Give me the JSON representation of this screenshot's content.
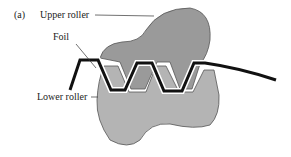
{
  "figure": {
    "panel_label": "(a)",
    "labels": {
      "upper_roller": "Upper roller",
      "foil": "Foil",
      "lower_roller": "Lower roller"
    },
    "colors": {
      "upper_roller_fill": "#9a9a9a",
      "lower_roller_fill": "#b4b4b4",
      "foil_stroke": "#111111",
      "outline": "#555555",
      "leader_line": "#333333"
    }
  }
}
